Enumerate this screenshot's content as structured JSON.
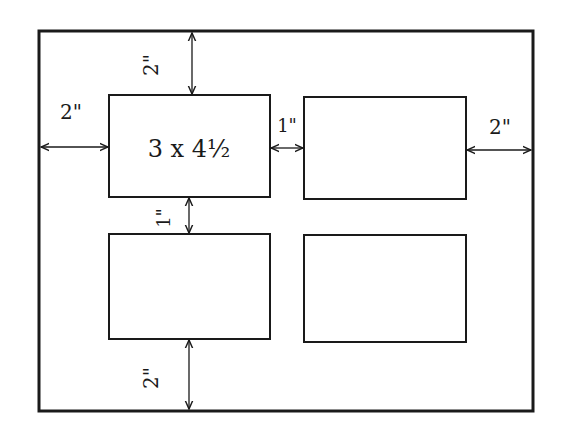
{
  "diagram": {
    "colors": {
      "line": "#1a1a1a",
      "background": "#ffffff"
    },
    "outer_frame": {
      "x": 39,
      "y": 31,
      "w": 494,
      "h": 380
    },
    "openings": [
      {
        "id": "top-left",
        "label": "3 x 4½",
        "x": 109,
        "y": 95,
        "w": 161,
        "h": 102
      },
      {
        "id": "top-right",
        "label": "",
        "x": 304,
        "y": 97,
        "w": 162,
        "h": 102
      },
      {
        "id": "bottom-left",
        "label": "",
        "x": 109,
        "y": 234,
        "w": 161,
        "h": 105
      },
      {
        "id": "bottom-right",
        "label": "",
        "x": 304,
        "y": 235,
        "w": 162,
        "h": 107
      }
    ],
    "dimensions": {
      "top_margin": {
        "label": "2\"",
        "orientation": "vertical"
      },
      "left_margin": {
        "label": "2\"",
        "orientation": "horizontal"
      },
      "between_columns": {
        "label": "1\"",
        "orientation": "horizontal"
      },
      "right_margin": {
        "label": "2\"",
        "orientation": "horizontal"
      },
      "between_rows": {
        "label": "1\"",
        "orientation": "vertical"
      },
      "bottom_margin": {
        "label": "2\"",
        "orientation": "vertical"
      }
    },
    "opening_size_label": "3 x 4½"
  }
}
